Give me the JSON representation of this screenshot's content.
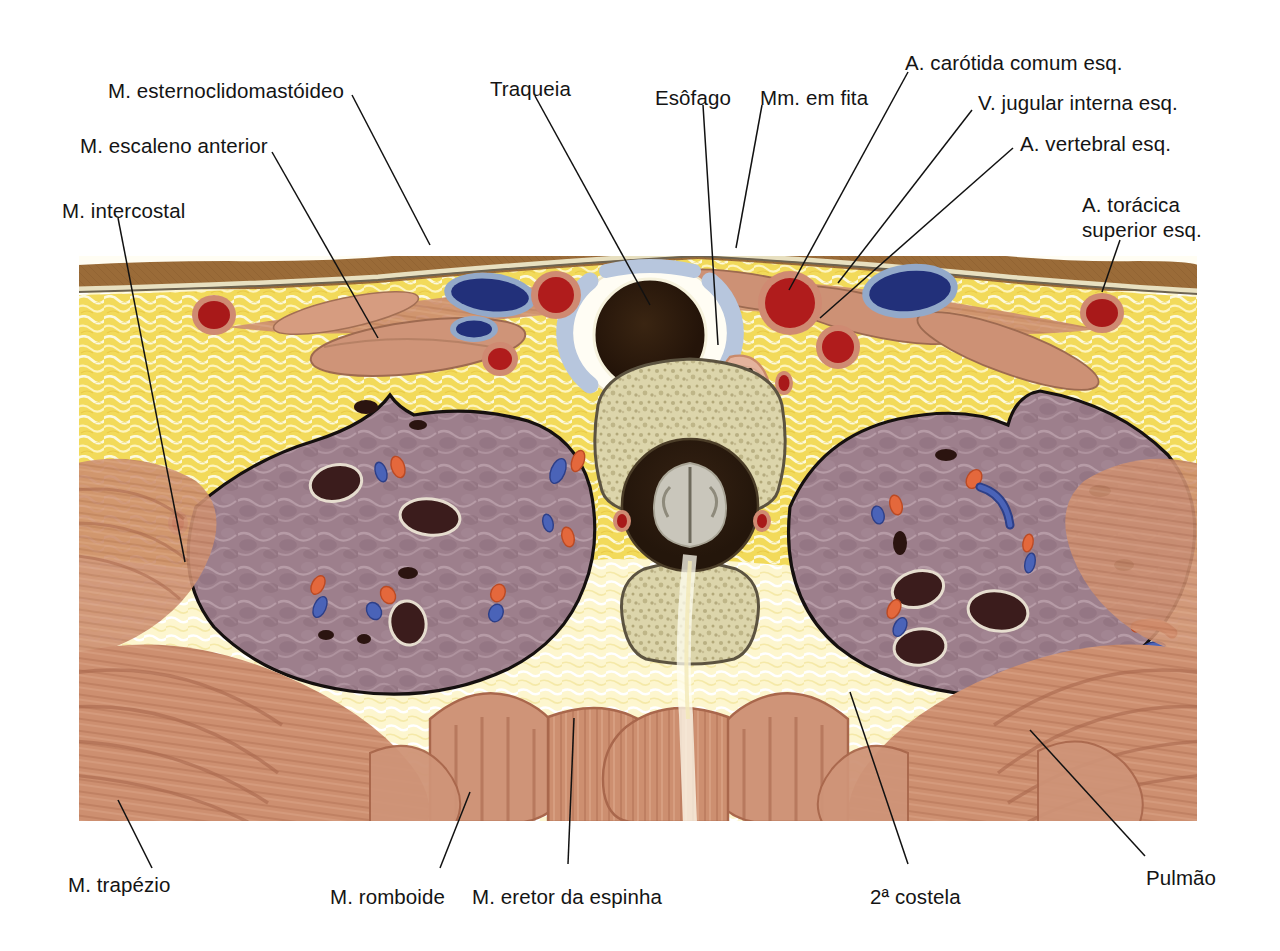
{
  "figure": {
    "language": "pt-BR",
    "background_color": "#ffffff",
    "illustration_bounds": {
      "x": 78,
      "y": 255,
      "width": 1120,
      "height": 567
    }
  },
  "palette": {
    "skin": "#9a6b38",
    "subcutaneous_fat": "#f2da5a",
    "fat_light": "#fdf6d2",
    "muscle": "#c98a6b",
    "muscle_dark": "#a9674c",
    "lung": "#9d7f8c",
    "lung_dark": "#7e6271",
    "bone": "#d9d2a8",
    "bone_outline": "#5c5340",
    "artery": "#b01c1c",
    "artery_wall": "#d9826a",
    "vein": "#22307a",
    "vein_wall": "#8fa8c8",
    "trachea_lumen": "#2a1a0e",
    "cartilage": "#b7c6dd",
    "spinal_cord": "#c9c6bb",
    "leader_line": "#111111",
    "text": "#141414"
  },
  "labels": [
    {
      "id": "m-esternoclidomastoideo",
      "text": "M. esternoclidomastóideo",
      "align": "left",
      "x": 108,
      "y": 78,
      "leader": [
        [
          352,
          95
        ],
        [
          430,
          245
        ]
      ]
    },
    {
      "id": "m-escaleno-anterior",
      "text": "M. escaleno anterior",
      "align": "left",
      "x": 80,
      "y": 133,
      "leader": [
        [
          272,
          152
        ],
        [
          378,
          338
        ]
      ]
    },
    {
      "id": "m-intercostal",
      "text": "M. intercostal",
      "align": "left",
      "x": 62,
      "y": 198,
      "leader": [
        [
          118,
          218
        ],
        [
          185,
          562
        ]
      ]
    },
    {
      "id": "traqueia",
      "text": "Traqueia",
      "align": "left",
      "x": 490,
      "y": 76,
      "leader": [
        [
          535,
          96
        ],
        [
          650,
          305
        ]
      ]
    },
    {
      "id": "esofago",
      "text": "Esôfago",
      "align": "left",
      "x": 655,
      "y": 85,
      "leader": [
        [
          703,
          105
        ],
        [
          718,
          345
        ]
      ]
    },
    {
      "id": "mm-em-fita",
      "text": "Mm. em fita",
      "align": "left",
      "x": 760,
      "y": 85,
      "leader": [
        [
          762,
          105
        ],
        [
          736,
          248
        ]
      ]
    },
    {
      "id": "a-carotida-comum-esq",
      "text": "A. carótida comum esq.",
      "align": "left",
      "x": 905,
      "y": 50,
      "leader": [
        [
          908,
          72
        ],
        [
          789,
          290
        ]
      ]
    },
    {
      "id": "v-jugular-interna-esq",
      "text": "V. jugular interna esq.",
      "align": "left",
      "x": 978,
      "y": 90,
      "leader": [
        [
          972,
          110
        ],
        [
          838,
          283
        ]
      ]
    },
    {
      "id": "a-vertebral-esq",
      "text": "A. vertebral esq.",
      "align": "left",
      "x": 1020,
      "y": 131,
      "leader": [
        [
          1013,
          148
        ],
        [
          820,
          318
        ]
      ]
    },
    {
      "id": "a-toracica-superior-esq",
      "text": "A. torácica\nsuperior esq.",
      "align": "left",
      "x": 1082,
      "y": 192,
      "leader": [
        [
          1120,
          240
        ],
        [
          1102,
          292
        ]
      ]
    },
    {
      "id": "m-trapezio",
      "text": "M. trapézio",
      "align": "left",
      "x": 68,
      "y": 872,
      "leader": [
        [
          152,
          868
        ],
        [
          118,
          800
        ]
      ]
    },
    {
      "id": "m-romboide",
      "text": "M. romboide",
      "align": "left",
      "x": 330,
      "y": 884,
      "leader": [
        [
          440,
          868
        ],
        [
          470,
          792
        ]
      ]
    },
    {
      "id": "m-eretor-da-espinha",
      "text": "M. eretor da espinha",
      "align": "left",
      "x": 472,
      "y": 884,
      "leader": [
        [
          568,
          864
        ],
        [
          574,
          718
        ]
      ]
    },
    {
      "id": "segunda-costela",
      "text": "2ª costela",
      "align": "left",
      "x": 870,
      "y": 884,
      "leader": [
        [
          908,
          864
        ],
        [
          850,
          692
        ]
      ]
    },
    {
      "id": "pulmao",
      "text": "Pulmão",
      "align": "left",
      "x": 1146,
      "y": 865,
      "leader": [
        [
          1145,
          856
        ],
        [
          1030,
          730
        ]
      ]
    }
  ],
  "structures": [
    {
      "name": "pele",
      "label_pt": "Pele"
    },
    {
      "name": "tecido-subcutaneo",
      "label_pt": "Tecido subcutâneo"
    },
    {
      "name": "traqueia",
      "label_pt": "Traqueia"
    },
    {
      "name": "esofago",
      "label_pt": "Esôfago"
    },
    {
      "name": "corpo-vertebral",
      "label_pt": "Corpo vertebral"
    },
    {
      "name": "medula-espinal",
      "label_pt": "Medula espinal"
    },
    {
      "name": "pulmao-direito",
      "label_pt": "Pulmão direito"
    },
    {
      "name": "pulmao-esquerdo",
      "label_pt": "Pulmão esquerdo"
    },
    {
      "name": "segunda-costela",
      "label_pt": "2ª costela"
    }
  ]
}
